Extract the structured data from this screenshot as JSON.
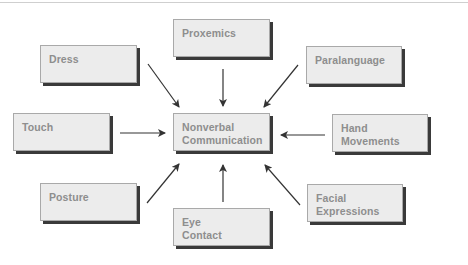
{
  "diagram": {
    "type": "hub-and-spoke",
    "center": {
      "line1": "Nonverbal",
      "line2": "Communication"
    },
    "nodes": [
      {
        "id": "proxemics",
        "line1": "Proxemics",
        "line2": ""
      },
      {
        "id": "dress",
        "line1": "Dress",
        "line2": ""
      },
      {
        "id": "paralanguage",
        "line1": "Paralanguage",
        "line2": ""
      },
      {
        "id": "touch",
        "line1": "Touch",
        "line2": ""
      },
      {
        "id": "hand-movements",
        "line1": "Hand",
        "line2": "Movements"
      },
      {
        "id": "posture",
        "line1": "Posture",
        "line2": ""
      },
      {
        "id": "facial-expressions",
        "line1": "Facial",
        "line2": "Expressions"
      },
      {
        "id": "eye-contact",
        "line1": "Eye",
        "line2": "Contact"
      }
    ],
    "edges": [
      {
        "from": "proxemics",
        "to": "center"
      },
      {
        "from": "dress",
        "to": "center"
      },
      {
        "from": "paralanguage",
        "to": "center"
      },
      {
        "from": "touch",
        "to": "center"
      },
      {
        "from": "hand-movements",
        "to": "center"
      },
      {
        "from": "posture",
        "to": "center"
      },
      {
        "from": "facial-expressions",
        "to": "center"
      },
      {
        "from": "eye-contact",
        "to": "center"
      }
    ]
  },
  "colors": {
    "box_fill": "#ececec",
    "box_border": "#a9a9a9",
    "box_shadow": "#3a3a3a",
    "text": "#8e8e8e",
    "arrow": "#333333"
  }
}
